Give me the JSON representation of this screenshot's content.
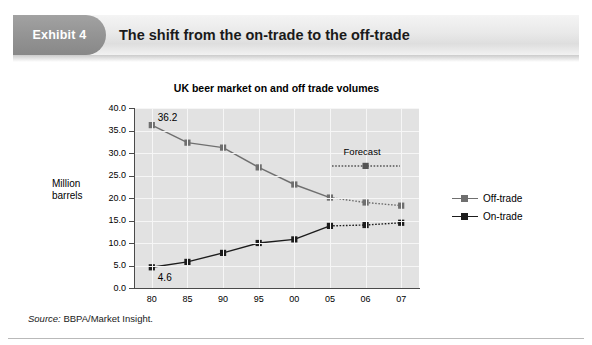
{
  "exhibit": {
    "badge_label": "Exhibit 4",
    "title": "The shift from the on-trade to the off-trade"
  },
  "source": {
    "keyword": "Source:",
    "text": " BBPA/Market Insight."
  },
  "legend": {
    "items": [
      {
        "label": "Off-trade",
        "color": "#6f6f6f",
        "icon": "line-marker-icon"
      },
      {
        "label": "On-trade",
        "color": "#1c1c1c",
        "icon": "line-marker-icon"
      }
    ]
  },
  "chart_data": {
    "type": "line",
    "title": "UK beer market on and off trade volumes",
    "xlabel": "",
    "ylabel": "Million barrels",
    "ylabel_lines": [
      "Million",
      "barrels"
    ],
    "categories": [
      "80",
      "85",
      "90",
      "95",
      "00",
      "05",
      "06",
      "07"
    ],
    "ylim": [
      0.0,
      40.0
    ],
    "ytick_labels": [
      "0.0",
      "5.0",
      "10.0",
      "15.0",
      "20.0",
      "25.0",
      "30.0",
      "35.0",
      "40.0"
    ],
    "ytick_values": [
      0.0,
      5.0,
      10.0,
      15.0,
      20.0,
      25.0,
      30.0,
      35.0,
      40.0
    ],
    "grid": true,
    "legend_position": "right",
    "forecast_from_index": 5,
    "series": [
      {
        "name": "Off-trade",
        "color": "#6f6f6f",
        "values": [
          36.2,
          32.3,
          31.2,
          26.8,
          23.0,
          20.1,
          19.0,
          18.3
        ]
      },
      {
        "name": "On-trade",
        "color": "#1c1c1c",
        "values": [
          4.6,
          5.8,
          7.8,
          10.0,
          10.8,
          13.8,
          14.0,
          14.5
        ]
      }
    ],
    "annotations": [
      {
        "text": "36.2",
        "series": "Off-trade",
        "category": "80",
        "value": 36.2
      },
      {
        "text": "4.6",
        "series": "On-trade",
        "category": "80",
        "value": 4.6
      },
      {
        "text": "Forecast",
        "kind": "region-label"
      }
    ]
  }
}
